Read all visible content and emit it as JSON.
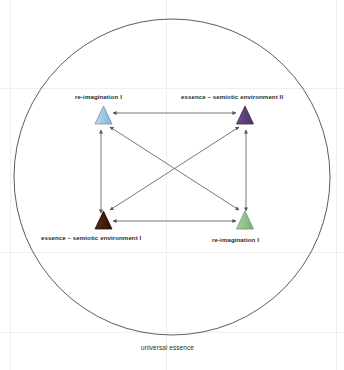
{
  "figure": {
    "caption": "universal essence",
    "boundary_shape_name": "universal-essence-circle",
    "colors": {
      "outline": "#4a4a4a",
      "arrow": "#555555",
      "text": "#2b2b2b",
      "background": "#ffffff"
    }
  },
  "nodes": [
    {
      "id": "top-left",
      "label": "re-imagination I",
      "marker": "triangle",
      "fill": "#8fcbe8",
      "stroke": "#9c7fa8",
      "cx": 103.5,
      "cy": 116,
      "label_x": 75,
      "label_y": 96
    },
    {
      "id": "top-right",
      "label": "essence – semiotic environment II",
      "marker": "triangle",
      "fill": "#5b3f7a",
      "stroke": "#3f2b56",
      "cx": 245,
      "cy": 116,
      "label_x": 182,
      "label_y": 96
    },
    {
      "id": "bottom-left",
      "label": "essence – semiotic environment I",
      "marker": "triangle",
      "fill": "#3d1a0d",
      "stroke": "#2a1208",
      "cx": 103.5,
      "cy": 220,
      "label_x": 42,
      "label_y": 236
    },
    {
      "id": "bottom-right",
      "label": "re-imagination I",
      "marker": "triangle",
      "fill": "#8fc08a",
      "stroke": "#6a9a66",
      "cx": 245,
      "cy": 220,
      "label_x": 212,
      "label_y": 238
    }
  ],
  "edges": [
    {
      "name": "edge-top-horizontal",
      "from": "top-left",
      "to": "top-right",
      "style": "double-arrow"
    },
    {
      "name": "edge-bottom-horizontal",
      "from": "bottom-left",
      "to": "bottom-right",
      "style": "double-arrow"
    },
    {
      "name": "edge-left-vertical",
      "from": "top-left",
      "to": "bottom-left",
      "style": "double-arrow"
    },
    {
      "name": "edge-right-vertical",
      "from": "top-right",
      "to": "bottom-right",
      "style": "double-arrow"
    },
    {
      "name": "edge-diagonal-tl-br",
      "from": "top-left",
      "to": "bottom-right",
      "style": "double-arrow"
    },
    {
      "name": "edge-diagonal-tr-bl",
      "from": "top-right",
      "to": "bottom-left",
      "style": "double-arrow"
    }
  ]
}
